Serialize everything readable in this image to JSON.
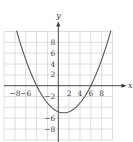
{
  "chart_data": {
    "type": "line",
    "title": "",
    "xlabel": "x",
    "ylabel": "y",
    "xlim": [
      -10,
      10
    ],
    "ylim": [
      -10,
      10
    ],
    "grid": true,
    "grid_step": 2,
    "x_ticks": [
      {
        "value": -8,
        "label": "−8"
      },
      {
        "value": -6,
        "label": "−6"
      },
      {
        "value": 2,
        "label": "2"
      },
      {
        "value": 4,
        "label": "4"
      },
      {
        "value": 6,
        "label": "6"
      },
      {
        "value": 8,
        "label": "8"
      }
    ],
    "y_ticks": [
      {
        "value": 8,
        "label": "8"
      },
      {
        "value": 6,
        "label": "6"
      },
      {
        "value": 4,
        "label": "4"
      },
      {
        "value": 2,
        "label": "2"
      },
      {
        "value": -2,
        "label": "−2"
      },
      {
        "value": -6,
        "label": "−6"
      },
      {
        "value": -8,
        "label": "−8"
      }
    ],
    "series": [
      {
        "name": "parabola",
        "function": "y = 0.2(x + 4)(x − 6)",
        "x_intercepts": [
          -4,
          6
        ],
        "vertex": [
          1,
          -5
        ],
        "x": [
          -7.7,
          -6,
          -4,
          -2,
          0,
          1,
          2,
          4,
          6,
          8,
          9.7
        ],
        "y": [
          10.1,
          6,
          0,
          -3.2,
          -4.8,
          -5,
          -4.8,
          -3.2,
          0,
          4.8,
          9.8
        ]
      }
    ],
    "legend": "none"
  }
}
